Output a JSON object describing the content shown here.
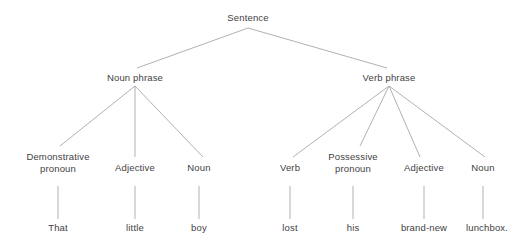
{
  "diagram": {
    "background_color": "#ffffff",
    "text_color": "#3f3f3f",
    "edge_color": "#a8a8a8",
    "sentence_text": "That little boy lost his brand-new lunchbox."
  },
  "nodes": {
    "root": {
      "label": "Sentence",
      "x": 248,
      "y": 17
    },
    "noun_phrase": {
      "label": "Noun phrase",
      "x": 135,
      "y": 77
    },
    "verb_phrase": {
      "label": "Verb phrase",
      "x": 389,
      "y": 77
    },
    "demonstrative_pronoun": {
      "label": "Demonstrative pronoun",
      "line1": "Demonstrative",
      "line2": "pronoun",
      "x": 58,
      "y": 153
    },
    "np_adjective": {
      "label": "Adjective",
      "x": 135,
      "y": 164
    },
    "np_noun": {
      "label": "Noun",
      "x": 199,
      "y": 164
    },
    "vp_verb": {
      "label": "Verb",
      "x": 290,
      "y": 164
    },
    "possessive_pronoun": {
      "label": "Possessive pronoun",
      "line1": "Possessive",
      "line2": "pronoun",
      "x": 353,
      "y": 153
    },
    "vp_adjective": {
      "label": "Adjective",
      "x": 424,
      "y": 164
    },
    "vp_noun": {
      "label": "Noun",
      "x": 483,
      "y": 164
    }
  },
  "leaves": [
    {
      "word": "That",
      "x": 58,
      "y": 224
    },
    {
      "word": "little",
      "x": 135,
      "y": 224
    },
    {
      "word": "boy",
      "x": 199,
      "y": 224
    },
    {
      "word": "lost",
      "x": 290,
      "y": 224
    },
    {
      "word": "his",
      "x": 353,
      "y": 224
    },
    {
      "word": "brand-new",
      "x": 424,
      "y": 224
    },
    {
      "word": "lunchbox.",
      "x": 487,
      "y": 224
    }
  ],
  "edges": [
    {
      "from": "root",
      "to": "noun_phrase"
    },
    {
      "from": "root",
      "to": "verb_phrase"
    },
    {
      "from": "noun_phrase",
      "to": "demonstrative_pronoun"
    },
    {
      "from": "noun_phrase",
      "to": "np_adjective"
    },
    {
      "from": "noun_phrase",
      "to": "np_noun"
    },
    {
      "from": "verb_phrase",
      "to": "vp_verb"
    },
    {
      "from": "verb_phrase",
      "to": "possessive_pronoun"
    },
    {
      "from": "verb_phrase",
      "to": "vp_adjective"
    },
    {
      "from": "verb_phrase",
      "to": "vp_noun"
    },
    {
      "from": "demonstrative_pronoun",
      "to": "leaf_that"
    },
    {
      "from": "np_adjective",
      "to": "leaf_little"
    },
    {
      "from": "np_noun",
      "to": "leaf_boy"
    },
    {
      "from": "vp_verb",
      "to": "leaf_lost"
    },
    {
      "from": "possessive_pronoun",
      "to": "leaf_his"
    },
    {
      "from": "vp_adjective",
      "to": "leaf_brand_new"
    },
    {
      "from": "vp_noun",
      "to": "leaf_lunchbox"
    }
  ]
}
